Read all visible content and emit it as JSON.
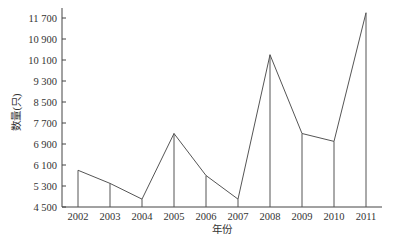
{
  "chart_data": {
    "type": "line",
    "title": "",
    "xlabel": "年份",
    "ylabel": "数量(只)",
    "categories": [
      "2002",
      "2003",
      "2004",
      "2005",
      "2006",
      "2007",
      "2008",
      "2009",
      "2010",
      "2011"
    ],
    "series": [
      {
        "name": "数量",
        "values": [
          5900,
          5400,
          4800,
          7300,
          5700,
          4800,
          10300,
          7300,
          7000,
          11900
        ]
      }
    ],
    "yticks": [
      4500,
      5300,
      6100,
      6900,
      7700,
      8500,
      9300,
      10100,
      10900,
      11700
    ],
    "ytick_labels": [
      "4 500",
      "5 300",
      "6 100",
      "6 900",
      "7 700",
      "8 500",
      "9 300",
      "10 100",
      "10 900",
      "11 700"
    ],
    "ylim": [
      4500,
      11900
    ],
    "grid": false,
    "drop_lines": true,
    "legend": null
  },
  "colors": {
    "line": "#555555",
    "axis": "#444444",
    "text": "#333333"
  }
}
